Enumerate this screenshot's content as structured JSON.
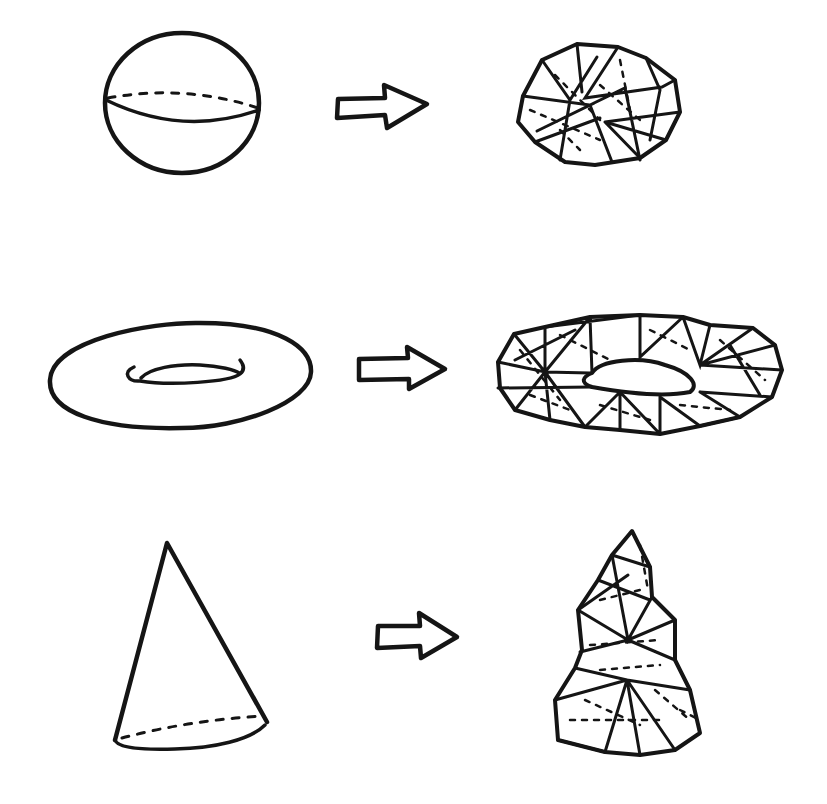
{
  "diagram": {
    "ink_color": "#151515",
    "background_color": "#ffffff",
    "rows": [
      {
        "source_shape": "sphere",
        "arrow": "right-arrow",
        "result_shape": "triangulated sphere mesh"
      },
      {
        "source_shape": "torus",
        "arrow": "right-arrow",
        "result_shape": "triangulated torus mesh"
      },
      {
        "source_shape": "cone",
        "arrow": "right-arrow",
        "result_shape": "triangulated cone mesh"
      }
    ]
  }
}
